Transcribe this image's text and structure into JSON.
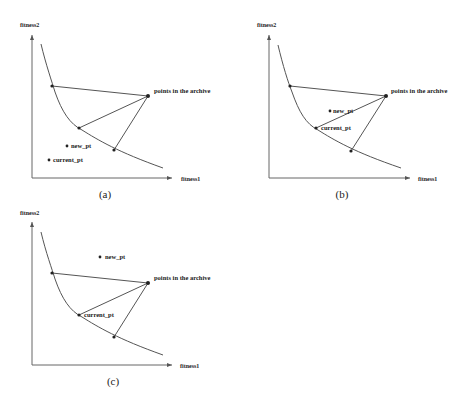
{
  "figure": {
    "axis_x_label": "fitness1",
    "axis_y_label": "fitness2",
    "archive_label": "points in the archive",
    "new_pt_label": "new_pt",
    "current_pt_label": "current_pt",
    "colors": {
      "stroke": "#555555",
      "text": "#222222",
      "background": "#ffffff"
    },
    "panels": [
      {
        "id": "a",
        "caption": "(a)",
        "description": "new_pt and current_pt both lie below the Pareto front, outside the triangle"
      },
      {
        "id": "b",
        "caption": "(b)",
        "description": "current_pt is on the front; new_pt lies inside the triangle formed with the archive point"
      },
      {
        "id": "c",
        "caption": "(c)",
        "description": "current_pt is on the front; new_pt lies above and outside the triangle"
      }
    ]
  }
}
